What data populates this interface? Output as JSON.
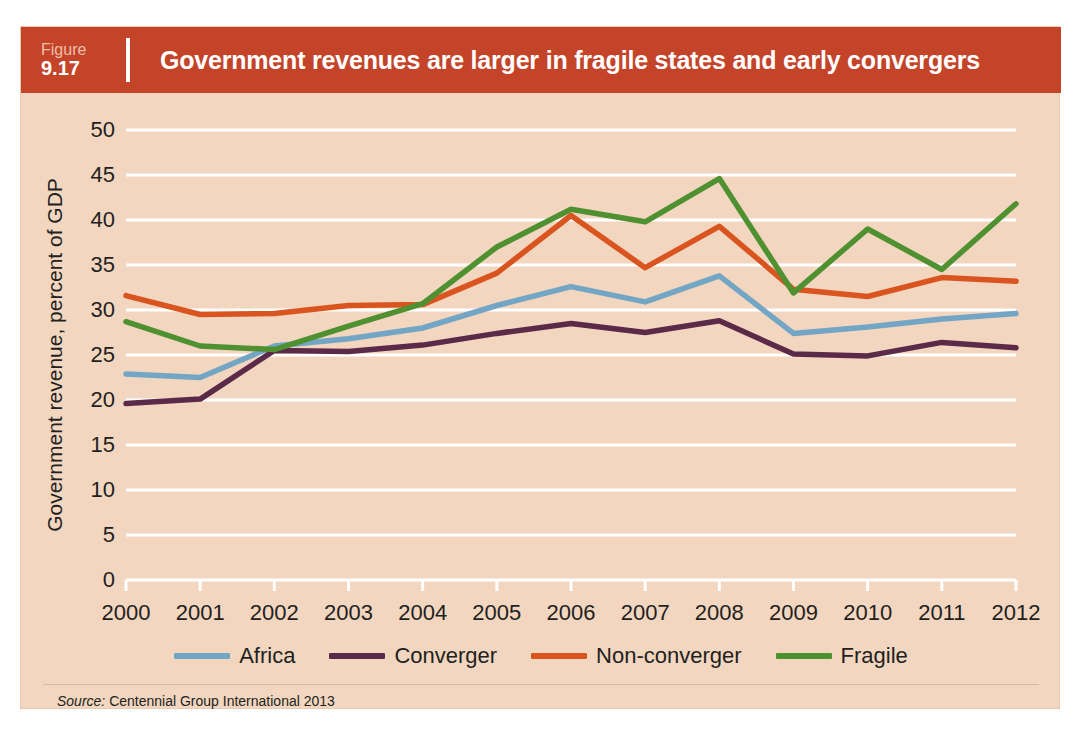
{
  "figure": {
    "label_word": "Figure",
    "number": "9.17",
    "title": "Government revenues are larger in fragile states and early convergers"
  },
  "source": {
    "prefix": "Source:",
    "text": "Centennial Group International 2013"
  },
  "colors": {
    "header_band": "#c4442a",
    "panel_background": "#f2d6bf",
    "gridline": "#ffffff",
    "axis_text": "#231f20",
    "africa": "#73a6c4",
    "converger": "#5b2a48",
    "non_converger": "#d9541f",
    "fragile": "#4f9031"
  },
  "chart_data": {
    "type": "line",
    "title": "Government revenues are larger in fragile states and early convergers",
    "xlabel": "",
    "ylabel": "Government revenue, percent of GDP",
    "x": [
      2000,
      2001,
      2002,
      2003,
      2004,
      2005,
      2006,
      2007,
      2008,
      2009,
      2010,
      2011,
      2012
    ],
    "categories": [
      "2000",
      "2001",
      "2002",
      "2003",
      "2004",
      "2005",
      "2006",
      "2007",
      "2008",
      "2009",
      "2010",
      "2011",
      "2012"
    ],
    "ylim": [
      0,
      50
    ],
    "yticks": [
      0,
      5,
      10,
      15,
      20,
      25,
      30,
      35,
      40,
      45,
      50
    ],
    "ytick_labels": [
      "0",
      "5",
      "10",
      "15",
      "20",
      "25",
      "30",
      "35",
      "40",
      "45",
      "50"
    ],
    "grid": true,
    "legend_position": "bottom",
    "series": [
      {
        "name": "Africa",
        "color": "#73a6c4",
        "values": [
          22.9,
          22.5,
          26.0,
          26.8,
          28.0,
          30.5,
          32.6,
          30.9,
          33.8,
          27.4,
          28.1,
          29.0,
          29.6
        ]
      },
      {
        "name": "Converger",
        "color": "#5b2a48",
        "values": [
          19.6,
          20.1,
          25.5,
          25.4,
          26.1,
          27.4,
          28.5,
          27.5,
          28.8,
          25.1,
          24.9,
          26.4,
          25.8
        ]
      },
      {
        "name": "Non-converger",
        "color": "#d9541f",
        "values": [
          31.6,
          29.5,
          29.6,
          30.5,
          30.6,
          34.1,
          40.5,
          34.7,
          39.3,
          32.3,
          31.5,
          33.6,
          33.2
        ]
      },
      {
        "name": "Fragile",
        "color": "#4f9031",
        "values": [
          28.7,
          26.0,
          25.6,
          28.2,
          30.7,
          37.0,
          41.2,
          39.8,
          44.6,
          31.9,
          39.0,
          34.5,
          41.8
        ]
      }
    ]
  },
  "legend": {
    "items": [
      {
        "label": "Africa",
        "color": "#73a6c4"
      },
      {
        "label": "Converger",
        "color": "#5b2a48"
      },
      {
        "label": "Non-converger",
        "color": "#d9541f"
      },
      {
        "label": "Fragile",
        "color": "#4f9031"
      }
    ]
  }
}
